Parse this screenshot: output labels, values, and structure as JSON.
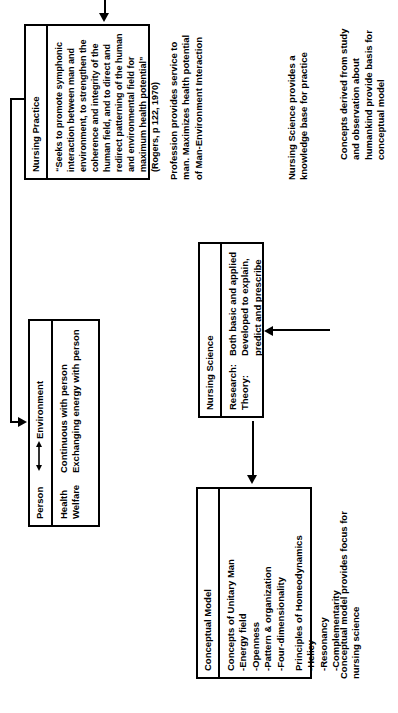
{
  "diagram": {
    "orientation_note": "rotated-90-ccw",
    "boxes": {
      "person_environment": {
        "name": "person-environment-box",
        "left_header": "Person",
        "arrow_glyph": "⟷",
        "right_header": "Environment",
        "rows": [
          {
            "left": "Health",
            "right": "Continuous with person"
          },
          {
            "left": "Welfare",
            "right": "Exchanging energy with person"
          }
        ]
      },
      "nursing_practice": {
        "name": "nursing-practice-box",
        "header": "Nursing Practice",
        "body": "“Seeks to promote symphonic interaction between man and environment, to strengthen the coherence and integrity of the human field, and to direct and redirect patterning of the human and environmental field for maximum health potential” (Rogers, p 122, 1970)"
      },
      "nursing_science": {
        "name": "nursing-science-box",
        "header": "Nursing Science",
        "rows": [
          {
            "label": "Research:",
            "value": "Both basic and applied"
          },
          {
            "label": "Theory:",
            "value": "Developed to explain, predict and prescribe"
          }
        ]
      },
      "conceptual_model": {
        "name": "conceptual-model-box",
        "header": "Conceptual Model",
        "group1_title": "Concepts of Unitary Man",
        "group1_items": [
          "-Energy field",
          "-Openness",
          "-Pattern & organization",
          "-Four-dimensionality"
        ],
        "group2_title": "Principles of Homeodynamics",
        "group2_items": [
          "-Helicy",
          "-Resonancy",
          "-Complementarity"
        ]
      }
    },
    "labels": {
      "profession_service": "Profession provides service to man. Maximizes health potential of Man-Environment Interaction",
      "nursing_science_knowledge": "Nursing Science provides a knowledge base for practice",
      "conceptual_model_focus": "Conceptual model provides focus for nursing science",
      "concepts_derived": "Concepts derived from study and observation about humankind provide basis for conceptual model"
    }
  }
}
